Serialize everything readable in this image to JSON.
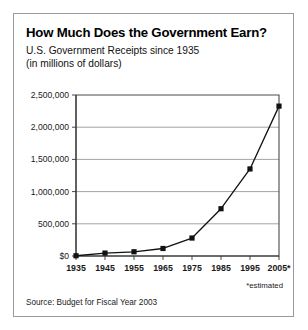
{
  "figure": {
    "title": "How Much Does the Government Earn?",
    "subtitle": "U.S. Government Receipts since 1935",
    "subtitle2": "(in millions of dollars)",
    "estimated_note": "*estimated",
    "source": "Source: Budget for Fiscal Year 2003",
    "border_color": "#9a9a9a"
  },
  "chart_data": {
    "type": "line",
    "title": "How Much Does the Government Earn?",
    "subtitle": "U.S. Government Receipts since 1935 (in millions of dollars)",
    "xlabel": "",
    "ylabel": "",
    "categories": [
      "1935",
      "1945",
      "1955",
      "1965",
      "1975",
      "1985",
      "1995",
      "2005*"
    ],
    "x": [
      1935,
      1945,
      1955,
      1965,
      1975,
      1985,
      1995,
      2005
    ],
    "values": [
      3700,
      45200,
      65500,
      116800,
      279100,
      734100,
      1351800,
      2327500
    ],
    "series": [
      {
        "name": "U.S. Government Receipts",
        "values": [
          3700,
          45200,
          65500,
          116800,
          279100,
          734100,
          1351800,
          2327500
        ],
        "color": "#111111",
        "marker": "square"
      }
    ],
    "ylim": [
      0,
      2500000
    ],
    "xlim": [
      1935,
      2005
    ],
    "ytick_labels": [
      "$0",
      "500,000",
      "1,000,000",
      "1,500,000",
      "2,000,000",
      "2,500,000"
    ],
    "ytick_values": [
      0,
      500000,
      1000000,
      1500000,
      2000000,
      2500000
    ],
    "xtick_labels": [
      "1935",
      "1945",
      "1955",
      "1965",
      "1975",
      "1985",
      "1995",
      "2005*"
    ],
    "grid": true,
    "grid_axis": "y",
    "legend": false,
    "legend_position": "none",
    "annotations": [
      "*estimated"
    ],
    "source": "Source: Budget for Fiscal Year 2003",
    "units": "millions of dollars"
  }
}
